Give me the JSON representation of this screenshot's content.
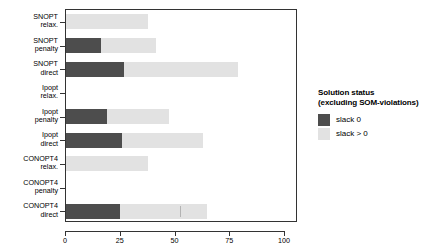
{
  "chart_data": {
    "type": "bar",
    "orientation": "horizontal",
    "stacked": true,
    "title": "",
    "xlabel": "",
    "ylabel": "",
    "xlim": [
      0,
      100
    ],
    "xticks": [
      0,
      25,
      50,
      75,
      100
    ],
    "xticklabels": [
      "0",
      "25",
      "50",
      "75",
      "100"
    ],
    "grid": false,
    "categories": [
      "SNOPT relax.",
      "SNOPT penalty",
      "SNOPT direct",
      "Ipopt relax.",
      "Ipopt penalty",
      "Ipopt direct",
      "CONOPT4 relax.",
      "CONOPT4 penalty",
      "CONOPT4 direct"
    ],
    "category_lines": [
      [
        "SNOPT",
        "relax."
      ],
      [
        "SNOPT",
        "penalty"
      ],
      [
        "SNOPT",
        "direct"
      ],
      [
        "Ipopt",
        "relax."
      ],
      [
        "Ipopt",
        "penalty"
      ],
      [
        "Ipopt",
        "direct"
      ],
      [
        "CONOPT4",
        "relax."
      ],
      [
        "CONOPT4",
        "penalty"
      ],
      [
        "CONOPT4",
        "direct"
      ]
    ],
    "series": [
      {
        "name": "slack 0",
        "color": "#4d4d4d",
        "values": [
          0,
          16,
          26.5,
          0,
          18.5,
          25.5,
          0,
          0,
          24.5
        ]
      },
      {
        "name": "slack > 0",
        "color": "#e2e2e2",
        "values": [
          37.5,
          25,
          52,
          0,
          28.5,
          37,
          37.5,
          0,
          40
        ]
      }
    ],
    "totals": [
      37.5,
      41,
      78.5,
      0,
      47,
      62.5,
      37.5,
      0,
      64.5
    ],
    "legend": {
      "position": "right",
      "title_line1": "Solution status",
      "title_line2": "(excluding SOM-violations)",
      "entries": [
        {
          "label": "slack 0",
          "color": "#4d4d4d"
        },
        {
          "label": "slack > 0",
          "color": "#e2e2e2"
        }
      ]
    },
    "annotations": [
      {
        "type": "inner-tick",
        "category": "CONOPT4 direct",
        "x": 52
      }
    ]
  }
}
